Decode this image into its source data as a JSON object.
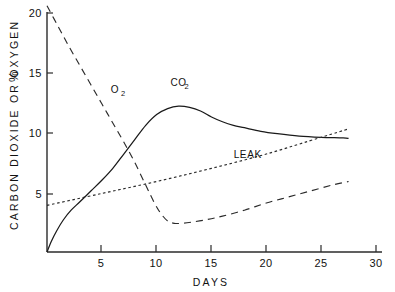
{
  "chart_data": {
    "type": "line",
    "title": "",
    "xlabel": "DAYS",
    "ylabel": "CARBON DIOXIDE OR OXYGEN",
    "ylabel_unit": "%",
    "xlim": [
      0,
      30
    ],
    "ylim": [
      0,
      21
    ],
    "xticks": [
      5,
      10,
      15,
      20,
      25,
      30
    ],
    "xtick_labels": [
      "5",
      "10",
      "15",
      "20",
      "25",
      "30"
    ],
    "yticks": [
      5,
      10,
      15,
      20
    ],
    "ytick_labels": [
      "5",
      "10",
      "15",
      "20"
    ],
    "grid": false,
    "legend_position": "inline-annotations",
    "series": [
      {
        "name": "CO2",
        "label": "CO",
        "label_sub": "2",
        "style": "solid",
        "label_x": 12.0,
        "label_y": 13.9,
        "x": [
          0.0,
          0.4,
          0.9,
          1.5,
          2.2,
          3.0,
          4.0,
          5.0,
          6.0,
          7.0,
          8.0,
          9.0,
          10.0,
          11.0,
          12.0,
          13.0,
          14.0,
          15.0,
          16.0,
          17.0,
          18.0,
          19.5,
          21.0,
          23.0,
          25.0,
          27.0,
          27.5
        ],
        "y": [
          0.0,
          0.9,
          1.8,
          2.7,
          3.5,
          4.2,
          5.1,
          6.0,
          7.0,
          8.2,
          9.4,
          10.6,
          11.5,
          12.0,
          12.2,
          12.1,
          11.8,
          11.3,
          10.9,
          10.6,
          10.4,
          10.1,
          9.9,
          9.7,
          9.6,
          9.55,
          9.5
        ]
      },
      {
        "name": "O2",
        "label": "O",
        "label_sub": "2",
        "style": "long-dash",
        "label_x": 6.2,
        "label_y": 13.3,
        "x": [
          0.0,
          1.0,
          2.0,
          3.0,
          4.0,
          5.0,
          6.0,
          7.0,
          8.0,
          9.0,
          9.8,
          10.4,
          11.0,
          11.6,
          12.3,
          13.2,
          14.5,
          16.0,
          18.0,
          20.0,
          22.0,
          24.0,
          26.0,
          27.5
        ],
        "y": [
          20.6,
          18.9,
          17.2,
          15.6,
          14.0,
          12.4,
          10.8,
          9.2,
          7.5,
          5.6,
          4.1,
          3.2,
          2.6,
          2.4,
          2.4,
          2.5,
          2.7,
          3.0,
          3.5,
          4.1,
          4.6,
          5.1,
          5.6,
          5.9
        ]
      },
      {
        "name": "LEAK",
        "label": "LEAK",
        "style": "dotted",
        "label_x": 18.3,
        "label_y": 7.9,
        "x": [
          0.0,
          5.0,
          10.0,
          15.0,
          20.0,
          25.0,
          27.5
        ],
        "y": [
          3.9,
          4.9,
          5.9,
          7.0,
          8.2,
          9.6,
          10.3
        ]
      }
    ]
  },
  "axes": {
    "x_title": "DAYS",
    "y_title": "CARBON DIOXIDE OR OXYGEN",
    "y_unit": "%"
  }
}
